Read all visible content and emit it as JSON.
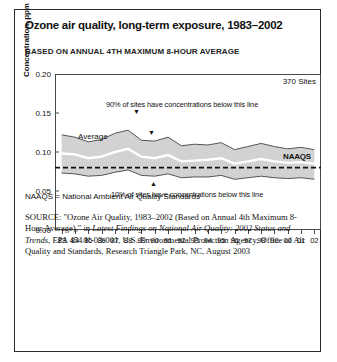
{
  "topstub": "",
  "figure": {
    "title": "Ozone air quality, long-term exposure, 1983–2002",
    "subtitle": "BASED ON ANNUAL 4TH MAXIMUM 8-HOUR AVERAGE",
    "sites_label": "370 Sites",
    "naaqs_label": "NAAQS",
    "average_label": "Average",
    "annotation_upper": "90% of sites have concentrations below this line",
    "annotation_lower": "10% of sites have concentrations below this line",
    "footnote": "NAAQS = National Ambient Air Quality Standards",
    "source": {
      "label": "SOURCE:",
      "part1": " \"Ozone Air Quality, 1983–2002 (Based on Annual 4th Maximum 8-Hour Average),\" in ",
      "italic1": "Latest Findings on National Air Quality: 2002 Status and Trends",
      "part2": ", EPA 454/K-03-001, U.S. Environmental Protection Agency, Office of Air Quality and Standards, Research Triangle Park, NC, August 2003"
    }
  },
  "chart_data": {
    "type": "area",
    "title": "Ozone air quality, long-term exposure, 1983–2002",
    "subtitle": "BASED ON ANNUAL 4TH MAXIMUM 8-HOUR AVERAGE",
    "xlabel": "",
    "ylabel": "Concentration, ppm",
    "ylim": [
      0.0,
      0.2
    ],
    "yticks": [
      0.0,
      0.05,
      0.1,
      0.15,
      0.2
    ],
    "ytick_labels": [
      "0.00",
      "0.05",
      "0.10",
      "0.15",
      "0.20"
    ],
    "grid": false,
    "legend": "none",
    "x": [
      "83",
      "84",
      "85",
      "86",
      "87",
      "88",
      "89",
      "90",
      "91",
      "92",
      "93",
      "94",
      "95",
      "96",
      "97",
      "98",
      "99",
      "00",
      "01",
      "02"
    ],
    "x_full_years": [
      1983,
      1984,
      1985,
      1986,
      1987,
      1988,
      1989,
      1990,
      1991,
      1992,
      1993,
      1994,
      1995,
      1996,
      1997,
      1998,
      1999,
      2000,
      2001,
      2002
    ],
    "series": [
      {
        "name": "90th percentile",
        "note": "90% of sites have concentrations below this line",
        "values": [
          0.122,
          0.119,
          0.113,
          0.116,
          0.124,
          0.128,
          0.115,
          0.114,
          0.119,
          0.108,
          0.11,
          0.109,
          0.112,
          0.103,
          0.107,
          0.111,
          0.107,
          0.104,
          0.106,
          0.103
        ]
      },
      {
        "name": "Average",
        "note": "Average",
        "values": [
          0.098,
          0.097,
          0.092,
          0.094,
          0.1,
          0.104,
          0.094,
          0.092,
          0.096,
          0.088,
          0.089,
          0.09,
          0.092,
          0.085,
          0.088,
          0.091,
          0.088,
          0.086,
          0.087,
          0.085
        ]
      },
      {
        "name": "10th percentile",
        "note": "10% of sites have concentrations below this line",
        "values": [
          0.073,
          0.072,
          0.069,
          0.07,
          0.074,
          0.077,
          0.07,
          0.069,
          0.072,
          0.067,
          0.068,
          0.068,
          0.07,
          0.065,
          0.067,
          0.069,
          0.067,
          0.066,
          0.067,
          0.065
        ]
      }
    ],
    "reference_line": {
      "name": "NAAQS",
      "value": 0.08,
      "style": "dashed"
    },
    "annotations": [
      {
        "text": "370 Sites",
        "position": "top-right"
      },
      {
        "text": "90% of sites have concentrations below this line",
        "position": "upper-interior"
      },
      {
        "text": "10% of sites have concentrations below this line",
        "position": "lower-interior"
      },
      {
        "text": "NAAQS",
        "position": "right-of-reference-line"
      },
      {
        "text": "Average",
        "position": "mid-left-interior"
      }
    ]
  }
}
